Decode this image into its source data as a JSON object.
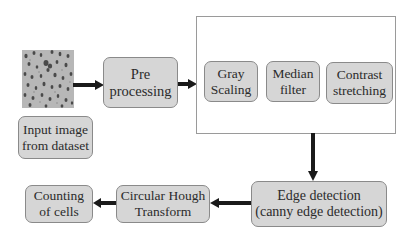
{
  "diagram": {
    "type": "flowchart",
    "nodes": {
      "input_image": {
        "label_lines": [
          "Input image",
          "from dataset"
        ]
      },
      "preprocessing": {
        "label_lines": [
          "Pre",
          "processing"
        ]
      },
      "gray_scaling": {
        "label_lines": [
          "Gray",
          "Scaling"
        ]
      },
      "median_filter": {
        "label_lines": [
          "Median",
          "filter"
        ]
      },
      "contrast_stretching": {
        "label_lines": [
          "Contrast",
          "stretching"
        ]
      },
      "edge_detection": {
        "label_lines": [
          "Edge detection",
          "(canny edge detection)"
        ]
      },
      "circular_hough": {
        "label_lines": [
          "Circular Hough",
          "Transform"
        ]
      },
      "counting": {
        "label_lines": [
          "Counting",
          "of cells"
        ]
      }
    },
    "groups": [
      {
        "id": "preprocessing_steps",
        "members": [
          "gray_scaling",
          "median_filter",
          "contrast_stretching"
        ]
      }
    ],
    "edges": [
      {
        "from": "input_image",
        "to": "preprocessing"
      },
      {
        "from": "preprocessing",
        "to": "preprocessing_steps"
      },
      {
        "from": "preprocessing_steps",
        "to": "edge_detection"
      },
      {
        "from": "edge_detection",
        "to": "circular_hough"
      },
      {
        "from": "circular_hough",
        "to": "counting"
      }
    ],
    "image_thumbnail": {
      "description": "microscope cell image sample",
      "icon": "cell-image-thumbnail"
    },
    "colors": {
      "node_fill": "#d6d6d6",
      "node_border": "#8a8a8a",
      "arrow": "#1a1a1a",
      "frame_border": "#9a9a9a"
    }
  }
}
